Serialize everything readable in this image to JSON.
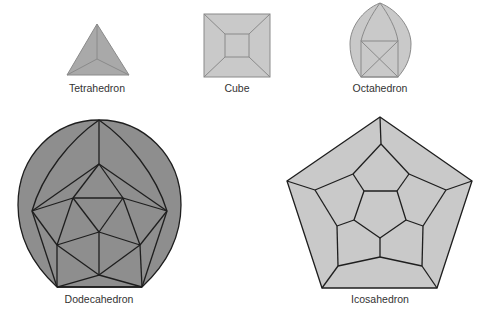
{
  "colors": {
    "light_fill": "#c9c9c9",
    "tetra_fill": "#a9a9a9",
    "dodeca_fill": "#8e8e8e",
    "light_stroke": "#8a8a8a",
    "dark_stroke": "#1e1e1e",
    "label": "#333333"
  },
  "solids": [
    {
      "name": "Tetrahedron",
      "label_x": 97,
      "label_y": 82
    },
    {
      "name": "Cube",
      "label_x": 237,
      "label_y": 82
    },
    {
      "name": "Octahedron",
      "label_x": 380,
      "label_y": 82
    },
    {
      "name": "Dodecahedron",
      "label_x": 99,
      "label_y": 293
    },
    {
      "name": "Icosahedron",
      "label_x": 380,
      "label_y": 293
    }
  ]
}
